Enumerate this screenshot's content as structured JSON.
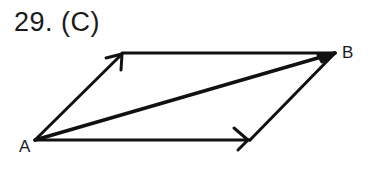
{
  "problem": {
    "number_label": "29. (C)"
  },
  "diagram": {
    "type": "vector-parallelogram",
    "vertices": {
      "A": {
        "label": "A"
      },
      "B": {
        "label": "B"
      }
    },
    "vectors": [
      {
        "name": "side-up",
        "from": "A",
        "to": "top-left",
        "arrow": true
      },
      {
        "name": "side-bottom",
        "from": "A",
        "to": "bottom-right",
        "arrow": true
      },
      {
        "name": "diagonal",
        "from": "A",
        "to": "B",
        "arrow": false
      },
      {
        "name": "top-edge",
        "from": "top-left",
        "to": "B",
        "arrow": false
      },
      {
        "name": "right-edge",
        "from": "B",
        "to": "bottom-right",
        "arrow": false
      }
    ],
    "stroke_color": "#111111"
  }
}
